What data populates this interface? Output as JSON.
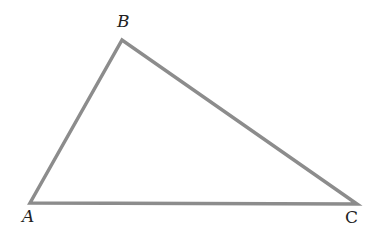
{
  "diagram": {
    "type": "triangle",
    "stroke_color": "#8c8c8c",
    "label_color": "#222222",
    "vertices": [
      {
        "name": "A",
        "label": "A",
        "x": 30,
        "y": 203
      },
      {
        "name": "B",
        "label": "B",
        "x": 122,
        "y": 40
      },
      {
        "name": "C",
        "label": "C",
        "x": 357,
        "y": 204
      }
    ],
    "edges": [
      "AB",
      "BC",
      "CA"
    ]
  }
}
